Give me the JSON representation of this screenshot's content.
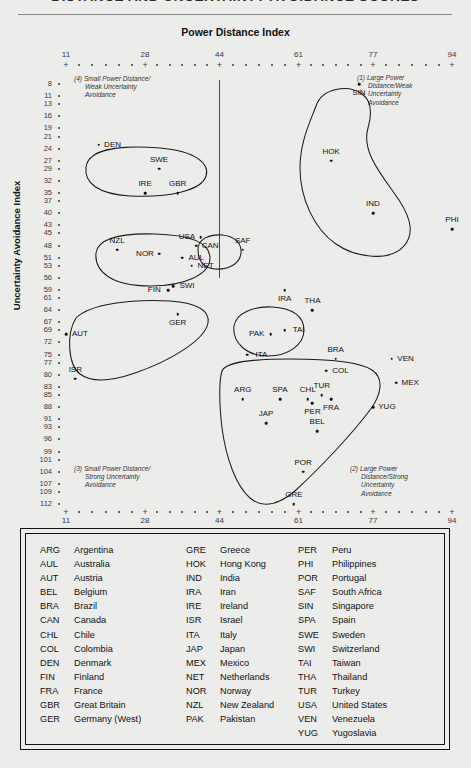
{
  "title": "DISTANCE AND UNCERTAINTY AVOIDANCE SCORES",
  "axes": {
    "x_title": "Power Distance Index",
    "y_title": "Uncertainty Avoidance Index",
    "x_major_ticks": [
      11,
      28,
      44,
      61,
      77,
      94
    ],
    "y_ticks": [
      8,
      11,
      13,
      16,
      19,
      21,
      24,
      27,
      29,
      32,
      35,
      37,
      40,
      43,
      45,
      48,
      51,
      53,
      56,
      59,
      61,
      64,
      67,
      69,
      72,
      75,
      77,
      80,
      83,
      85,
      88,
      91,
      93,
      96,
      99,
      101,
      104,
      107,
      109,
      112
    ]
  },
  "quadrants": [
    {
      "id": "q4",
      "lines": [
        "(4) Small Power Distance/",
        "Weak Uncertainty",
        "Avoidance"
      ]
    },
    {
      "id": "q1",
      "lines": [
        "(1) Large Power",
        "Distance/Weak",
        "Uncertainty",
        "Avoidance"
      ]
    },
    {
      "id": "q3",
      "lines": [
        "(3) Small Power Distance/",
        "Strong Uncertainty",
        "Avoidance"
      ]
    },
    {
      "id": "q2",
      "lines": [
        "(2) Large Power",
        "Distance/Strong",
        "Uncertainty",
        "Avoidance"
      ]
    }
  ],
  "chart_data": {
    "type": "scatter",
    "title": "DISTANCE AND UNCERTAINTY AVOIDANCE SCORES",
    "xlabel": "Power Distance Index",
    "ylabel": "Uncertainty Avoidance Index",
    "xlim": [
      11,
      94
    ],
    "ylim": [
      8,
      112
    ],
    "grid": false,
    "legend": "none",
    "points": [
      {
        "code": "DEN",
        "x": 18,
        "y": 23,
        "label_pos": "right"
      },
      {
        "code": "SWE",
        "x": 31,
        "y": 29,
        "label_pos": "above"
      },
      {
        "code": "IRE",
        "x": 28,
        "y": 35,
        "label_pos": "above"
      },
      {
        "code": "GBR",
        "x": 35,
        "y": 35,
        "label_pos": "above"
      },
      {
        "code": "NZL",
        "x": 22,
        "y": 49,
        "label_pos": "above"
      },
      {
        "code": "USA",
        "x": 40,
        "y": 46,
        "label_pos": "left"
      },
      {
        "code": "CAN",
        "x": 39,
        "y": 48,
        "label_pos": "right"
      },
      {
        "code": "NOR",
        "x": 31,
        "y": 50,
        "label_pos": "left"
      },
      {
        "code": "AUL",
        "x": 36,
        "y": 51,
        "label_pos": "right"
      },
      {
        "code": "NET",
        "x": 38,
        "y": 53,
        "label_pos": "right"
      },
      {
        "code": "SAF",
        "x": 49,
        "y": 49,
        "label_pos": "above"
      },
      {
        "code": "FIN",
        "x": 33,
        "y": 59,
        "label_pos": "left"
      },
      {
        "code": "SWI",
        "x": 34,
        "y": 58,
        "label_pos": "right"
      },
      {
        "code": "GER",
        "x": 35,
        "y": 65,
        "label_pos": "below"
      },
      {
        "code": "AUT",
        "x": 11,
        "y": 70,
        "label_pos": "right"
      },
      {
        "code": "ISR",
        "x": 13,
        "y": 81,
        "label_pos": "above"
      },
      {
        "code": "IRA",
        "x": 58,
        "y": 59,
        "label_pos": "below"
      },
      {
        "code": "THA",
        "x": 64,
        "y": 64,
        "label_pos": "above"
      },
      {
        "code": "PAK",
        "x": 55,
        "y": 70,
        "label_pos": "left"
      },
      {
        "code": "TAI",
        "x": 58,
        "y": 69,
        "label_pos": "right"
      },
      {
        "code": "ITA",
        "x": 50,
        "y": 75,
        "label_pos": "right"
      },
      {
        "code": "BRA",
        "x": 69,
        "y": 76,
        "label_pos": "above"
      },
      {
        "code": "VEN",
        "x": 81,
        "y": 76,
        "label_pos": "right"
      },
      {
        "code": "COL",
        "x": 67,
        "y": 79,
        "label_pos": "right"
      },
      {
        "code": "ARG",
        "x": 49,
        "y": 86,
        "label_pos": "above"
      },
      {
        "code": "SPA",
        "x": 57,
        "y": 86,
        "label_pos": "above"
      },
      {
        "code": "CHL",
        "x": 63,
        "y": 86,
        "label_pos": "above"
      },
      {
        "code": "TUR",
        "x": 66,
        "y": 85,
        "label_pos": "above"
      },
      {
        "code": "MEX",
        "x": 82,
        "y": 82,
        "label_pos": "right"
      },
      {
        "code": "FRA",
        "x": 68,
        "y": 86,
        "label_pos": "below"
      },
      {
        "code": "YUG",
        "x": 77,
        "y": 88,
        "label_pos": "right"
      },
      {
        "code": "PER",
        "x": 64,
        "y": 87,
        "label_pos": "below"
      },
      {
        "code": "JAP",
        "x": 54,
        "y": 92,
        "label_pos": "above"
      },
      {
        "code": "BEL",
        "x": 65,
        "y": 94,
        "label_pos": "above"
      },
      {
        "code": "POR",
        "x": 62,
        "y": 104,
        "label_pos": "above"
      },
      {
        "code": "GRE",
        "x": 60,
        "y": 112,
        "label_pos": "above"
      },
      {
        "code": "SIN",
        "x": 74,
        "y": 8,
        "label_pos": "below"
      },
      {
        "code": "HOK",
        "x": 68,
        "y": 27,
        "label_pos": "above"
      },
      {
        "code": "IND",
        "x": 77,
        "y": 40,
        "label_pos": "above"
      },
      {
        "code": "PHI",
        "x": 94,
        "y": 44,
        "label_pos": "above"
      }
    ]
  },
  "legend": {
    "columns": [
      [
        {
          "code": "ARG",
          "name": "Argentina"
        },
        {
          "code": "AUL",
          "name": "Australia"
        },
        {
          "code": "AUT",
          "name": "Austria"
        },
        {
          "code": "BEL",
          "name": "Belgium"
        },
        {
          "code": "BRA",
          "name": "Brazil"
        },
        {
          "code": "CAN",
          "name": "Canada"
        },
        {
          "code": "CHL",
          "name": "Chile"
        },
        {
          "code": "COL",
          "name": "Colombia"
        },
        {
          "code": "DEN",
          "name": "Denmark"
        },
        {
          "code": "FIN",
          "name": "Finland"
        },
        {
          "code": "FRA",
          "name": "France"
        },
        {
          "code": "GBR",
          "name": "Great Britain"
        },
        {
          "code": "GER",
          "name": "Germany (West)"
        }
      ],
      [
        {
          "code": "GRE",
          "name": "Greece"
        },
        {
          "code": "HOK",
          "name": "Hong Kong"
        },
        {
          "code": "IND",
          "name": "India"
        },
        {
          "code": "IRA",
          "name": "Iran"
        },
        {
          "code": "IRE",
          "name": "Ireland"
        },
        {
          "code": "ISR",
          "name": "Israel"
        },
        {
          "code": "ITA",
          "name": "Italy"
        },
        {
          "code": "JAP",
          "name": "Japan"
        },
        {
          "code": "MEX",
          "name": "Mexico"
        },
        {
          "code": "NET",
          "name": "Netherlands"
        },
        {
          "code": "NOR",
          "name": "Norway"
        },
        {
          "code": "NZL",
          "name": "New Zealand"
        },
        {
          "code": "PAK",
          "name": "Pakistan"
        }
      ],
      [
        {
          "code": "PER",
          "name": "Peru"
        },
        {
          "code": "PHI",
          "name": "Philippines"
        },
        {
          "code": "POR",
          "name": "Portugal"
        },
        {
          "code": "SAF",
          "name": "South Africa"
        },
        {
          "code": "SIN",
          "name": "Singapore"
        },
        {
          "code": "SPA",
          "name": "Spain"
        },
        {
          "code": "SWE",
          "name": "Sweden"
        },
        {
          "code": "SWI",
          "name": "Switzerland"
        },
        {
          "code": "TAI",
          "name": "Taiwan"
        },
        {
          "code": "THA",
          "name": "Thailand"
        },
        {
          "code": "TUR",
          "name": "Turkey"
        },
        {
          "code": "USA",
          "name": "United States"
        },
        {
          "code": "VEN",
          "name": "Venezuela"
        },
        {
          "code": "YUG",
          "name": "Yugoslavia"
        }
      ]
    ]
  }
}
